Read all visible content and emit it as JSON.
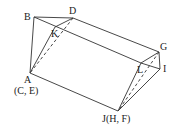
{
  "figure": {
    "type": "geometric-solid-folding",
    "colors": {
      "line": "#333333",
      "text": "#222222",
      "background": "#ffffff"
    },
    "vertices": {
      "B": {
        "label": "B",
        "x": 34,
        "y": 17
      },
      "D": {
        "label": "D",
        "x": 73,
        "y": 18
      },
      "K": {
        "label": "K",
        "x": 55,
        "y": 27
      },
      "A": {
        "label": "A",
        "x": 30,
        "y": 73
      },
      "G": {
        "label": "G",
        "x": 159,
        "y": 52
      },
      "L": {
        "label": "L",
        "x": 141,
        "y": 63
      },
      "I": {
        "label": "I",
        "x": 160,
        "y": 69
      },
      "J": {
        "label": "J(H, F)",
        "x": 118,
        "y": 111
      }
    },
    "labels": {
      "B": "B",
      "D": "D",
      "K": "K",
      "A": "A",
      "A_sub": "(C, E)",
      "G": "G",
      "L": "L",
      "I": "I",
      "J": "J(H, F)"
    },
    "edges_solid": [
      [
        "B",
        "D"
      ],
      [
        "D",
        "G"
      ],
      [
        "B",
        "L"
      ],
      [
        "L",
        "G"
      ],
      [
        "G",
        "I"
      ],
      [
        "L",
        "I"
      ],
      [
        "L",
        "J"
      ],
      [
        "I",
        "J"
      ],
      [
        "B",
        "A"
      ],
      [
        "K",
        "A"
      ],
      [
        "K",
        "D"
      ],
      [
        "A",
        "J"
      ]
    ],
    "edges_dashed": [
      [
        "D",
        "A"
      ],
      [
        "G",
        "J"
      ]
    ]
  }
}
